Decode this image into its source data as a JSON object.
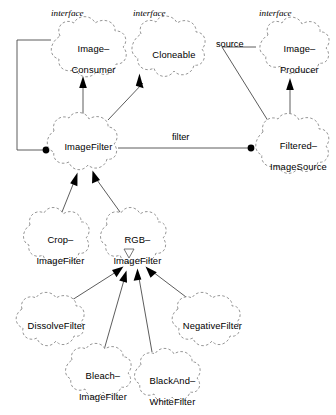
{
  "diagram": {
    "kind": "uml-class-diagram",
    "notation": "booch-cloud",
    "background_color": "#ffffff",
    "line_color": "#4a4a4a",
    "node_outline_color": "#8a8a8a",
    "text_color": "#000000",
    "stereotype_label": "interface",
    "nodes": [
      {
        "id": "image-consumer",
        "label": "Image–\nConsumer",
        "label_line1": "Image–",
        "label_line2": "Consumer",
        "stereotype": "interface",
        "is_interface": true,
        "x": 49,
        "y": 22,
        "w": 78,
        "h": 58
      },
      {
        "id": "cloneable",
        "label": "Cloneable",
        "label_line1": "Cloneable",
        "label_line2": "",
        "stereotype": "interface",
        "is_interface": true,
        "x": 130,
        "y": 22,
        "w": 75,
        "h": 58
      },
      {
        "id": "image-producer",
        "label": "Image–\nProducer",
        "label_line1": "Image–",
        "label_line2": "Producer",
        "stereotype": "interface",
        "is_interface": true,
        "x": 258,
        "y": 22,
        "w": 72,
        "h": 56
      },
      {
        "id": "image-filter",
        "label": "ImageFilter",
        "label_line1": "ImageFilter",
        "label_line2": "",
        "stereotype": "",
        "is_interface": false,
        "x": 42,
        "y": 118,
        "w": 82,
        "h": 55
      },
      {
        "id": "filtered-image-source",
        "label": "Filtered–\nImageSource",
        "label_line1": "Filtered–",
        "label_line2": "ImageSource",
        "stereotype": "",
        "is_interface": false,
        "x": 253,
        "y": 118,
        "w": 81,
        "h": 57
      },
      {
        "id": "crop-image-filter",
        "label": "Crop–\nImageFilter",
        "label_line1": "Crop–",
        "label_line2": "ImageFilter",
        "stereotype": "",
        "is_interface": false,
        "x": 20,
        "y": 212,
        "w": 72,
        "h": 55
      },
      {
        "id": "rgb-image-filter",
        "label": "RGB–\nImageFilter",
        "label_line1": "RGB–",
        "label_line2": "ImageFilter",
        "stereotype": "",
        "is_interface": false,
        "x": 97,
        "y": 212,
        "w": 72,
        "h": 55
      },
      {
        "id": "dissolve-filter",
        "label": "DissolveFilter",
        "label_line1": "DissolveFilter",
        "label_line2": "",
        "stereotype": "",
        "is_interface": false,
        "x": 12,
        "y": 297,
        "w": 78,
        "h": 53
      },
      {
        "id": "negative-filter",
        "label": "NegativeFilter",
        "label_line1": "NegativeFilter",
        "label_line2": "",
        "stereotype": "",
        "is_interface": false,
        "x": 168,
        "y": 297,
        "w": 78,
        "h": 53
      },
      {
        "id": "bleach-image-filter",
        "label": "Bleach–\nImageFilter",
        "label_line1": "Bleach–",
        "label_line2": "ImageFilter",
        "stereotype": "",
        "is_interface": false,
        "x": 62,
        "y": 347,
        "w": 72,
        "h": 55
      },
      {
        "id": "black-and-white-filter",
        "label": "BlackAnd–\nWhiteFilter",
        "label_line1": "BlackAnd–",
        "label_line2": "WhiteFilter",
        "stereotype": "",
        "is_interface": false,
        "x": 131,
        "y": 352,
        "w": 72,
        "h": 55
      }
    ],
    "edges": [
      {
        "id": "imagefilter-implements-imageconsumer",
        "from": "image-filter",
        "to": "image-consumer",
        "type": "inheritance",
        "label": ""
      },
      {
        "id": "imagefilter-implements-cloneable",
        "from": "image-filter",
        "to": "cloneable",
        "type": "inheritance",
        "label": ""
      },
      {
        "id": "filteredimagesource-implements-imageproducer",
        "from": "filtered-image-source",
        "to": "image-producer",
        "type": "inheritance",
        "label": ""
      },
      {
        "id": "filteredimagesource-source-imageproducer",
        "from": "filtered-image-source",
        "to": "image-producer",
        "type": "association",
        "label": "source"
      },
      {
        "id": "filteredimagesource-filter-imagefilter",
        "from": "filtered-image-source",
        "to": "image-filter",
        "type": "association",
        "label": "filter"
      },
      {
        "id": "imagefilter-uses-imageconsumer",
        "from": "image-filter",
        "to": "image-consumer",
        "type": "association",
        "label": ""
      },
      {
        "id": "cropimagefilter-extends-imagefilter",
        "from": "crop-image-filter",
        "to": "image-filter",
        "type": "inheritance",
        "label": ""
      },
      {
        "id": "rgbimagefilter-extends-imagefilter",
        "from": "rgb-image-filter",
        "to": "image-filter",
        "type": "inheritance",
        "label": ""
      },
      {
        "id": "dissolvefilter-extends-rgbimagefilter",
        "from": "dissolve-filter",
        "to": "rgb-image-filter",
        "type": "inheritance",
        "label": ""
      },
      {
        "id": "bleachimagefilter-extends-rgbimagefilter",
        "from": "bleach-image-filter",
        "to": "rgb-image-filter",
        "type": "inheritance",
        "label": ""
      },
      {
        "id": "blackandwhitefilter-extends-rgbimagefilter",
        "from": "black-and-white-filter",
        "to": "rgb-image-filter",
        "type": "inheritance",
        "label": ""
      },
      {
        "id": "negativefilter-extends-rgbimagefilter",
        "from": "negative-filter",
        "to": "rgb-image-filter",
        "type": "inheritance",
        "label": ""
      }
    ],
    "edge_labels": {
      "source": "source",
      "filter": "filter"
    }
  }
}
